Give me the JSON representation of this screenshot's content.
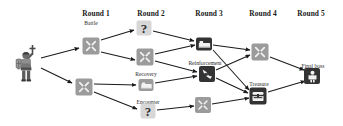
{
  "diagram": {
    "background": "#ffffff",
    "colors": {
      "tile_gray": "#9b9b9b",
      "tile_light_gray": "#d7d7d7",
      "tile_dark": "#333333",
      "icon_light": "#f2f2f2",
      "arrow": "#1a1a1a",
      "text": "#1a1a1a"
    },
    "round_headers": [
      {
        "label": "Round 1",
        "x": 96,
        "y": 9
      },
      {
        "label": "Round 2",
        "x": 151,
        "y": 9
      },
      {
        "label": "Round 3",
        "x": 209,
        "y": 9
      },
      {
        "label": "Round 4",
        "x": 263,
        "y": 9
      },
      {
        "label": "Round 5",
        "x": 311,
        "y": 9
      }
    ],
    "hero": {
      "name": "knight-character",
      "x": 27,
      "y": 63
    },
    "nodes": [
      {
        "id": "r1-battle-top",
        "icon": "crossed-swords-icon",
        "tile": "gray",
        "size": 17,
        "x": 91,
        "y": 46,
        "label": "Battle",
        "label_x": 91,
        "label_y": 20
      },
      {
        "id": "r1-battle-bottom",
        "icon": "crossed-swords-icon",
        "tile": "gray",
        "size": 17,
        "x": 84,
        "y": 87,
        "label": "",
        "label_x": 0,
        "label_y": 0
      },
      {
        "id": "r2-question-top",
        "icon": "question-mark-icon",
        "tile": "lightgray",
        "size": 15,
        "x": 144,
        "y": 28,
        "label": "",
        "label_x": 0,
        "label_y": 0
      },
      {
        "id": "r2-battle",
        "icon": "crossed-swords-icon",
        "tile": "gray",
        "size": 17,
        "x": 145,
        "y": 57,
        "label": "",
        "label_x": 0,
        "label_y": 0
      },
      {
        "id": "r2-recovery",
        "icon": "bed-icon",
        "tile": "gray",
        "size": 15,
        "x": 146,
        "y": 85,
        "label": "Recovery",
        "label_x": 146,
        "label_y": 71
      },
      {
        "id": "r2-question-bottom",
        "icon": "question-mark-icon",
        "tile": "lightgray",
        "size": 15,
        "x": 148,
        "y": 111,
        "label": "Encounter",
        "label_x": 148,
        "label_y": 99
      },
      {
        "id": "r3-recovery",
        "icon": "bed-icon",
        "tile": "dark",
        "size": 16,
        "x": 204,
        "y": 44,
        "label": "",
        "label_x": 0,
        "label_y": 0
      },
      {
        "id": "r3-reinforcement",
        "icon": "reinforcement-icon",
        "tile": "dark",
        "size": 16,
        "x": 207,
        "y": 74,
        "label": "Reinforcement",
        "label_x": 205,
        "label_y": 60
      },
      {
        "id": "r3-battle",
        "icon": "crossed-swords-icon",
        "tile": "gray",
        "size": 16,
        "x": 203,
        "y": 105,
        "label": "",
        "label_x": 0,
        "label_y": 0
      },
      {
        "id": "r4-battle",
        "icon": "crossed-swords-icon",
        "tile": "gray",
        "size": 17,
        "x": 260,
        "y": 52,
        "label": "",
        "label_x": 0,
        "label_y": 0
      },
      {
        "id": "r4-treasure",
        "icon": "treasure-chest-icon",
        "tile": "dark",
        "size": 17,
        "x": 258,
        "y": 96,
        "label": "Treasure",
        "label_x": 259,
        "label_y": 81
      },
      {
        "id": "r5-final-boss",
        "icon": "final-boss-icon",
        "tile": "dark",
        "size": 16,
        "x": 312,
        "y": 76,
        "label": "Final boss",
        "label_x": 313,
        "label_y": 63
      }
    ],
    "edges": [
      {
        "from": "hero",
        "to": "r1-battle-top"
      },
      {
        "from": "hero",
        "to": "r1-battle-bottom"
      },
      {
        "from": "r1-battle-top",
        "to": "r2-question-top"
      },
      {
        "from": "r1-battle-top",
        "to": "r2-battle"
      },
      {
        "from": "r1-battle-bottom",
        "to": "r2-recovery"
      },
      {
        "from": "r1-battle-bottom",
        "to": "r2-question-bottom"
      },
      {
        "from": "r2-question-top",
        "to": "r3-recovery"
      },
      {
        "from": "r2-battle",
        "to": "r3-recovery"
      },
      {
        "from": "r2-battle",
        "to": "r3-reinforcement"
      },
      {
        "from": "r2-recovery",
        "to": "r3-reinforcement"
      },
      {
        "from": "r2-question-bottom",
        "to": "r3-battle"
      },
      {
        "from": "r3-recovery",
        "to": "r4-battle"
      },
      {
        "from": "r3-recovery",
        "to": "r4-treasure"
      },
      {
        "from": "r3-reinforcement",
        "to": "r4-battle"
      },
      {
        "from": "r3-reinforcement",
        "to": "r4-treasure"
      },
      {
        "from": "r3-battle",
        "to": "r4-treasure"
      },
      {
        "from": "r4-battle",
        "to": "r5-final-boss"
      },
      {
        "from": "r4-treasure",
        "to": "r5-final-boss"
      }
    ]
  }
}
